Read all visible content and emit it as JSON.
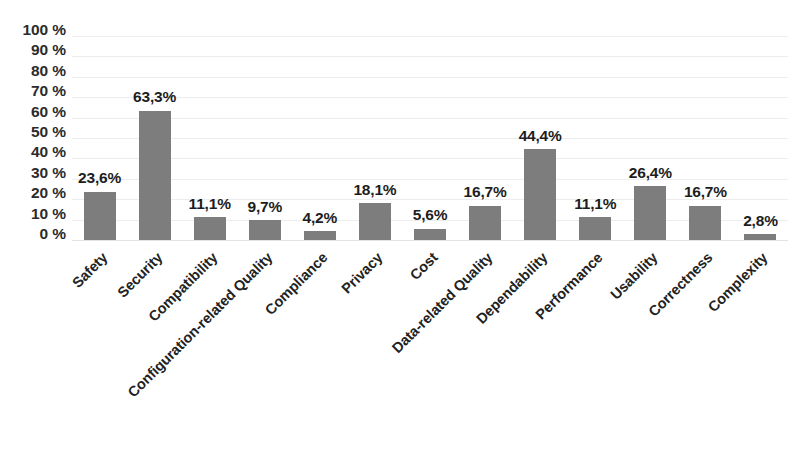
{
  "chart_data": {
    "type": "bar",
    "title": "",
    "subtitle": "",
    "xlabel": "",
    "ylabel": "",
    "ylim": [
      0,
      100
    ],
    "grid": true,
    "legend": "none",
    "orientation": "vertical",
    "decimal_separator": ",",
    "bar_color": "#7d7d7d",
    "gridline_color": "#ededed",
    "categories": [
      "Safety",
      "Security",
      "Compatibility",
      "Configuration-related Quality",
      "Compliance",
      "Privacy",
      "Cost",
      "Data-related Quality",
      "Dependability",
      "Performance",
      "Usability",
      "Correctness",
      "Complexity"
    ],
    "values": [
      23.6,
      63.3,
      11.1,
      9.7,
      4.2,
      18.1,
      5.6,
      16.7,
      44.4,
      11.1,
      26.4,
      16.7,
      2.8
    ],
    "data_labels": [
      "23,6%",
      "63,3%",
      "11,1%",
      "9,7%",
      "4,2%",
      "18,1%",
      "5,6%",
      "16,7%",
      "44,4%",
      "11,1%",
      "26,4%",
      "16,7%",
      "2,8%"
    ],
    "yticks": [
      0,
      10,
      20,
      30,
      40,
      50,
      60,
      70,
      80,
      90,
      100
    ],
    "ytick_labels": [
      "0 %",
      "10 %",
      "20 %",
      "30 %",
      "40 %",
      "50 %",
      "60 %",
      "70 %",
      "80 %",
      "90 %",
      "100 %"
    ]
  }
}
